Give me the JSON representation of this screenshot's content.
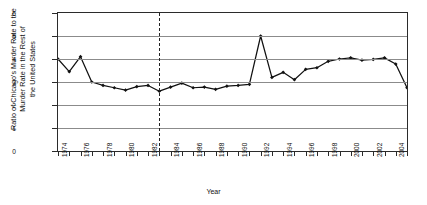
{
  "chart_data": {
    "type": "line",
    "title": "",
    "xlabel": "Year",
    "ylabel_lines": [
      "Ratio of Chicago's Murder Rate to the",
      "Murder Rate in the Rest of",
      "the United States"
    ],
    "ylabel": "Ratio of Chicago's Murder Rate to the Murder Rate in the Rest of the United States",
    "ylim": [
      0,
      6
    ],
    "yticks": [
      0,
      1,
      2,
      3,
      4,
      5,
      6
    ],
    "xlim": [
      1974,
      2005
    ],
    "xticks": [
      1974,
      1975,
      1976,
      1977,
      1978,
      1979,
      1980,
      1981,
      1982,
      1983,
      1984,
      1985,
      1986,
      1987,
      1988,
      1989,
      1990,
      1991,
      1992,
      1993,
      1994,
      1995,
      1996,
      1997,
      1998,
      1999,
      2000,
      2001,
      2002,
      2003,
      2004,
      2005
    ],
    "xtick_labels": [
      "1974",
      "1976",
      "1978",
      "1980",
      "1982",
      "1984",
      "1986",
      "1988",
      "1990",
      "1992",
      "1994",
      "1996",
      "1998",
      "2000",
      "2002",
      "2004"
    ],
    "xtick_labels_years": [
      1974,
      1976,
      1978,
      1980,
      1982,
      1984,
      1986,
      1988,
      1990,
      1992,
      1994,
      1996,
      1998,
      2000,
      2002,
      2004
    ],
    "grid": "horizontal",
    "legend": "none",
    "markers": "filled-diamond",
    "line_color": "#111111",
    "grid_color": "#8b8b8b",
    "annotations": [
      {
        "type": "vertical-dashed-line",
        "x": 1983,
        "label": ""
      }
    ],
    "x": [
      1974,
      1975,
      1976,
      1977,
      1978,
      1979,
      1980,
      1981,
      1982,
      1983,
      1984,
      1985,
      1986,
      1987,
      1988,
      1989,
      1990,
      1991,
      1992,
      1993,
      1994,
      1995,
      1996,
      1997,
      1998,
      1999,
      2000,
      2001,
      2002,
      2003,
      2004,
      2005
    ],
    "values": [
      4.0,
      3.45,
      4.1,
      3.0,
      2.85,
      2.75,
      2.65,
      2.8,
      2.85,
      2.6,
      2.78,
      2.95,
      2.75,
      2.78,
      2.68,
      2.82,
      2.85,
      2.9,
      5.0,
      3.2,
      3.42,
      3.1,
      3.55,
      3.62,
      3.9,
      4.0,
      4.05,
      3.95,
      3.98,
      4.05,
      3.78,
      2.75
    ],
    "series": [
      {
        "name": "Ratio of Chicago's Murder Rate to the Murder Rate in the Rest of the United States",
        "values": [
          4.0,
          3.45,
          4.1,
          3.0,
          2.85,
          2.75,
          2.65,
          2.8,
          2.85,
          2.6,
          2.78,
          2.95,
          2.75,
          2.78,
          2.68,
          2.82,
          2.85,
          2.9,
          5.0,
          3.2,
          3.42,
          3.1,
          3.55,
          3.62,
          3.9,
          4.0,
          4.05,
          3.95,
          3.98,
          4.05,
          3.78,
          2.75
        ]
      }
    ],
    "peak": {
      "year": 1992,
      "value": 5.0
    },
    "final": {
      "year": 2005,
      "value": 2.75
    }
  }
}
